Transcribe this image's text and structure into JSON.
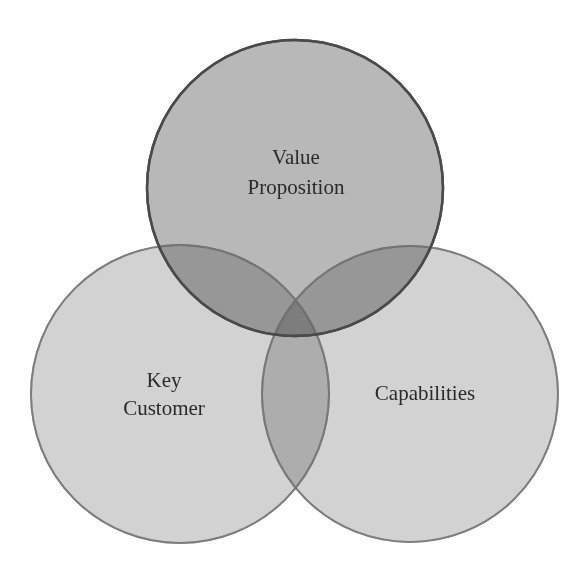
{
  "diagram": {
    "type": "venn",
    "circle_count": 3,
    "background": "#ffffff",
    "circles": [
      {
        "id": "value-proposition",
        "label_lines": [
          "Value",
          "Proposition"
        ],
        "cx": 295,
        "cy": 188,
        "r": 148,
        "fill": "#a6a6a6",
        "stroke": "#555555",
        "label_x": 296,
        "label_y": [
          164,
          194
        ]
      },
      {
        "id": "key-customer",
        "label_lines": [
          "Key",
          "Customer"
        ],
        "cx": 180,
        "cy": 394,
        "r": 149,
        "fill": "#d2d2d2",
        "stroke": "#8a8a8a",
        "label_x": 164,
        "label_y": [
          387,
          415
        ]
      },
      {
        "id": "capabilities",
        "label_lines": [
          "Capabilities"
        ],
        "cx": 410,
        "cy": 394,
        "r": 148,
        "fill": "#d2d2d2",
        "stroke": "#8a8a8a",
        "label_x": 425,
        "label_y": [
          400
        ]
      }
    ],
    "labels": {
      "value_proposition_line1": "Value",
      "value_proposition_line2": "Proposition",
      "key_customer_line1": "Key",
      "key_customer_line2": "Customer",
      "capabilities": "Capabilities"
    }
  }
}
